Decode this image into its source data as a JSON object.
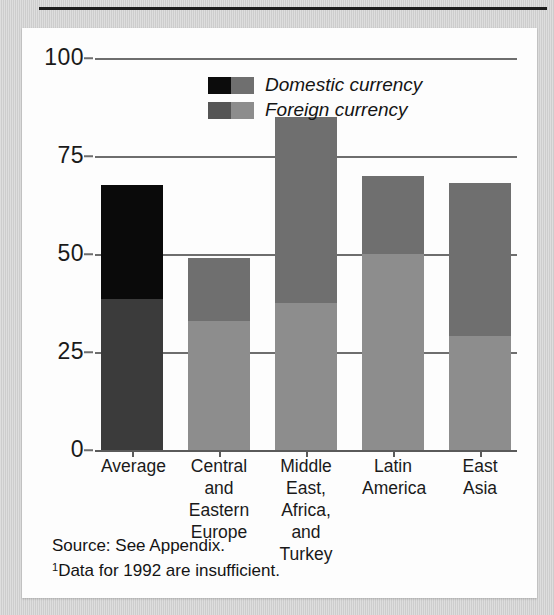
{
  "chart_data": {
    "type": "bar",
    "subtype": "stacked",
    "title": "",
    "xlabel": "",
    "ylabel": "",
    "ylim": [
      0,
      100
    ],
    "yticks": [
      0,
      25,
      50,
      75,
      100
    ],
    "grid": true,
    "legend_position": "top-center",
    "categories": [
      "Average",
      "Central and Eastern Europe",
      "Middle East, Africa, and Turkey",
      "Latin America",
      "East Asia"
    ],
    "category_lines": [
      [
        "Average"
      ],
      [
        "Central",
        "and",
        "Eastern",
        "Europe"
      ],
      [
        "Middle",
        "East,",
        "Africa,",
        "and",
        "Turkey"
      ],
      [
        "Latin",
        "America"
      ],
      [
        "East",
        "Asia"
      ]
    ],
    "series": [
      {
        "name": "Foreign currency",
        "values": [
          38.5,
          33,
          37.5,
          50,
          29
        ]
      },
      {
        "name": "Domestic currency",
        "values": [
          29,
          16,
          47.5,
          20,
          39
        ]
      }
    ],
    "totals": [
      67.5,
      49,
      85,
      70,
      68
    ]
  },
  "legend": {
    "items": [
      {
        "label": "Domestic currency",
        "key": "domestic"
      },
      {
        "label": "Foreign currency",
        "key": "foreign"
      }
    ]
  },
  "axis": {
    "y_labels": [
      "100",
      "75",
      "50",
      "25",
      "0"
    ]
  },
  "notes": {
    "source": "Source: See Appendix.",
    "footnote_marker": "1",
    "footnote": "Data for 1992 are insufficient."
  },
  "colors": {
    "domestic_dark": "#0a0a0a",
    "foreign_dark": "#3b3b3b",
    "domestic_gray": "#6f6f6f",
    "foreign_gray": "#8d8d8d",
    "gridline": "#6e6e6e",
    "panel_background": "#fdfdfd",
    "page_background": "#cdcdcd",
    "rule": "#1d1d1d"
  }
}
